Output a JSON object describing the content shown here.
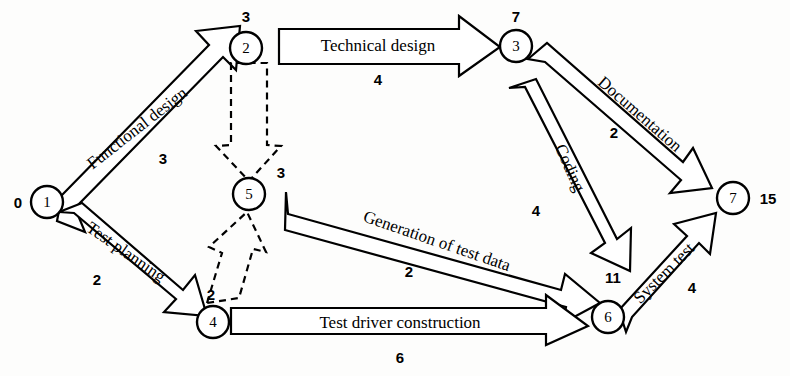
{
  "diagram": {
    "type": "pert-network",
    "title": "",
    "nodes": [
      {
        "id": "n1",
        "label": "1",
        "event_time": "0",
        "cx": 47,
        "cy": 202,
        "r": 16,
        "time_x": 18,
        "time_y": 202
      },
      {
        "id": "n2",
        "label": "2",
        "event_time": "3",
        "cx": 246,
        "cy": 48,
        "r": 16,
        "time_x": 246,
        "time_y": 16
      },
      {
        "id": "n3",
        "label": "3",
        "event_time": "7",
        "cx": 516,
        "cy": 46,
        "r": 16,
        "time_x": 516,
        "time_y": 16
      },
      {
        "id": "n5",
        "label": "5",
        "event_time": "3",
        "cx": 249,
        "cy": 194,
        "r": 16,
        "time_x": 281,
        "time_y": 172
      },
      {
        "id": "n4",
        "label": "4",
        "event_time": "2",
        "cx": 213,
        "cy": 322,
        "r": 16,
        "time_x": 211,
        "time_y": 294
      },
      {
        "id": "n6",
        "label": "6",
        "event_time": "11",
        "cx": 608,
        "cy": 317,
        "r": 16,
        "time_x": 613,
        "time_y": 277
      },
      {
        "id": "n7",
        "label": "7",
        "event_time": "15",
        "cx": 733,
        "cy": 198,
        "r": 16,
        "time_x": 768,
        "time_y": 198
      }
    ],
    "activities": [
      {
        "id": "a-functional-design",
        "label": "Functional design",
        "duration": "3",
        "from": "n1",
        "to": "n2",
        "style": "solid",
        "label_x": 137,
        "label_y": 128,
        "label_rot": -38,
        "dur_x": 163,
        "dur_y": 158
      },
      {
        "id": "a-technical-design",
        "label": "Technical design",
        "duration": "4",
        "from": "n2",
        "to": "n3",
        "style": "solid",
        "label_x": 378,
        "label_y": 45,
        "label_rot": 0,
        "dur_x": 378,
        "dur_y": 79
      },
      {
        "id": "a-documentation",
        "label": "Documentation",
        "duration": "2",
        "from": "n3",
        "to": "n7",
        "style": "solid",
        "label_x": 640,
        "label_y": 114,
        "label_rot": 41,
        "dur_x": 614,
        "dur_y": 132
      },
      {
        "id": "a-coding",
        "label": "Coding",
        "duration": "4",
        "from": "n3",
        "to": "n6",
        "style": "solid",
        "label_x": 570,
        "label_y": 168,
        "label_rot": 66,
        "dur_x": 536,
        "dur_y": 210
      },
      {
        "id": "a-test-planning",
        "label": "Test planning",
        "duration": "2",
        "from": "n1",
        "to": "n4",
        "style": "solid",
        "label_x": 126,
        "label_y": 252,
        "label_rot": 35,
        "dur_x": 97,
        "dur_y": 279
      },
      {
        "id": "a-generation-test-data",
        "label": "Generation of test data",
        "duration": "2",
        "from": "n5",
        "to": "n6",
        "style": "solid",
        "label_x": 437,
        "label_y": 241,
        "label_rot": 19,
        "dur_x": 409,
        "dur_y": 271
      },
      {
        "id": "a-test-driver-construction",
        "label": "Test driver construction",
        "duration": "6",
        "from": "n4",
        "to": "n6",
        "style": "solid",
        "label_x": 400,
        "label_y": 325,
        "label_rot": 0,
        "dur_x": 400,
        "dur_y": 357
      },
      {
        "id": "a-system-test",
        "label": "System test",
        "duration": "4",
        "from": "n6",
        "to": "n7",
        "style": "solid",
        "label_x": 664,
        "label_y": 273,
        "label_rot": -45,
        "dur_x": 692,
        "dur_y": 287
      },
      {
        "id": "a-dummy-2-5",
        "label": "",
        "duration": "",
        "from": "n2",
        "to": "n5",
        "style": "dashed",
        "label_x": 0,
        "label_y": 0,
        "label_rot": 0,
        "dur_x": 0,
        "dur_y": 0
      },
      {
        "id": "a-dummy-4-5",
        "label": "",
        "duration": "",
        "from": "n4",
        "to": "n5",
        "style": "dashed",
        "label_x": 0,
        "label_y": 0,
        "label_rot": 0,
        "dur_x": 0,
        "dur_y": 0
      }
    ],
    "colors": {
      "ink": "#000000",
      "paper": "#fdfdfc",
      "fill": "#ffffff"
    }
  }
}
